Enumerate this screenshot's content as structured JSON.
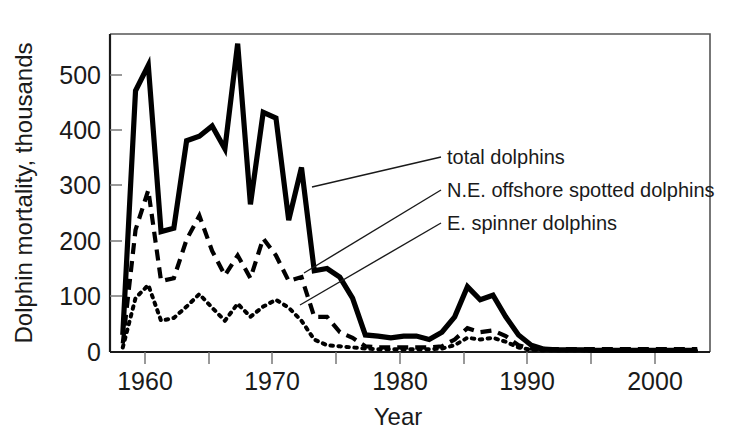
{
  "chart_data": {
    "type": "line",
    "title": "",
    "xlabel": "Year",
    "ylabel": "Dolphin mortality, thousands",
    "xlim": [
      1958,
      2005
    ],
    "ylim": [
      0,
      560
    ],
    "grid": false,
    "legend_position": "inline-annotations",
    "xticks": [
      1960,
      1965,
      1970,
      1975,
      1980,
      1985,
      1990,
      1995,
      2000,
      2005
    ],
    "xtick_labels": [
      "1960",
      "",
      "1970",
      "",
      "1980",
      "",
      "1990",
      "",
      "2000",
      ""
    ],
    "yticks": [
      0,
      100,
      200,
      300,
      400,
      500
    ],
    "ytick_labels": [
      "0",
      "100",
      "200",
      "300",
      "400",
      "500"
    ],
    "x": [
      1959,
      1960,
      1961,
      1962,
      1963,
      1964,
      1965,
      1966,
      1967,
      1968,
      1969,
      1970,
      1971,
      1972,
      1973,
      1974,
      1975,
      1976,
      1977,
      1978,
      1979,
      1980,
      1981,
      1982,
      1983,
      1984,
      1985,
      1986,
      1987,
      1988,
      1989,
      1990,
      1991,
      1992,
      1993,
      1994,
      1995,
      1996,
      1997,
      1998,
      1999,
      2000,
      2001,
      2002,
      2003,
      2004
    ],
    "series": [
      {
        "name": "total dolphins",
        "style": "solid",
        "values": [
          30,
          460,
          505,
          212,
          218,
          372,
          380,
          398,
          358,
          543,
          260,
          422,
          412,
          232,
          325,
          143,
          147,
          132,
          95,
          30,
          28,
          25,
          28,
          28,
          22,
          35,
          62,
          115,
          92,
          100,
          62,
          30,
          12,
          5,
          4,
          4,
          4,
          3,
          3,
          3,
          3,
          3,
          3,
          3,
          3,
          3
        ]
      },
      {
        "name": "N.E. offshore spotted dolphins",
        "style": "dashed",
        "values": [
          15,
          215,
          285,
          125,
          130,
          198,
          240,
          178,
          135,
          170,
          130,
          200,
          170,
          125,
          132,
          62,
          62,
          35,
          25,
          10,
          8,
          8,
          8,
          8,
          8,
          10,
          22,
          42,
          35,
          38,
          28,
          12,
          6,
          5,
          5,
          5,
          5,
          5,
          5,
          5,
          5,
          5,
          5,
          5,
          5,
          5
        ]
      },
      {
        "name": "E. spinner dolphins",
        "style": "dotted",
        "values": [
          8,
          95,
          118,
          55,
          60,
          80,
          102,
          78,
          55,
          85,
          62,
          80,
          92,
          78,
          55,
          22,
          12,
          10,
          8,
          6,
          5,
          5,
          5,
          5,
          5,
          6,
          12,
          25,
          22,
          25,
          18,
          8,
          4,
          3,
          3,
          3,
          3,
          2,
          2,
          2,
          2,
          2,
          2,
          2,
          2,
          2
        ]
      }
    ],
    "annotations": [
      {
        "text": "total dolphins",
        "label_x": 447,
        "label_y": 163
      },
      {
        "text": "N.E. offshore spotted dolphins",
        "label_x": 447,
        "label_y": 196
      },
      {
        "text": "E. spinner dolphins",
        "label_x": 447,
        "label_y": 229
      }
    ]
  },
  "axis": {
    "y_title": "Dolphin mortality, thousands",
    "x_title": "Year",
    "ytick_0": "0",
    "ytick_100": "100",
    "ytick_200": "200",
    "ytick_300": "300",
    "ytick_400": "400",
    "ytick_500": "500",
    "xtick_1960": "1960",
    "xtick_1970": "1970",
    "xtick_1980": "1980",
    "xtick_1990": "1990",
    "xtick_2000": "2000"
  },
  "annotations": {
    "total": "total dolphins",
    "spotted": "N.E. offshore spotted dolphins",
    "spinner": "E. spinner dolphins"
  }
}
